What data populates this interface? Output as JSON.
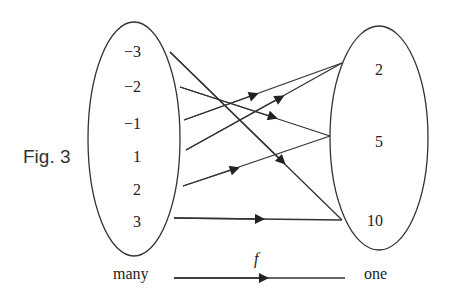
{
  "figure_label": "Fig. 3",
  "domain_set": {
    "elements": [
      "−3",
      "−2",
      "−1",
      "1",
      "2",
      "3"
    ]
  },
  "codomain_set": {
    "elements": [
      "2",
      "5",
      "10"
    ]
  },
  "mappings": [
    {
      "from": "−3",
      "to": "10"
    },
    {
      "from": "−2",
      "to": "5"
    },
    {
      "from": "−1",
      "to": "2"
    },
    {
      "from": "1",
      "to": "2"
    },
    {
      "from": "2",
      "to": "5"
    },
    {
      "from": "3",
      "to": "10"
    }
  ],
  "bottom": {
    "left_label": "many",
    "function_label": "f",
    "right_label": "one"
  },
  "colors": {
    "stroke": "#333333",
    "text": "#222222"
  }
}
